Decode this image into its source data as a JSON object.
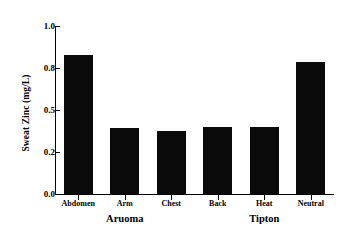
{
  "chart_data": {
    "type": "bar",
    "title": "",
    "xlabel": "",
    "ylabel": "Sweat Zinc (mg/L)",
    "categories": [
      "Abdomen",
      "Arm",
      "Chest",
      "Back",
      "Heat",
      "Neutral"
    ],
    "values": [
      0.86,
      0.37,
      0.35,
      0.38,
      0.38,
      0.83
    ],
    "ylim": [
      0.0,
      1.0
    ],
    "ytick_labels": [
      "1.0",
      "0.8",
      "0.5",
      "0.2",
      "0.0"
    ],
    "ytick_values": [
      1.0,
      0.8,
      0.5,
      0.2,
      0.0
    ],
    "grid": false,
    "legend": "none",
    "bar_color": "#0a0a0a",
    "groups": [
      {
        "label": "Aruoma",
        "categories": [
          "Abdomen",
          "Arm",
          "Chest"
        ]
      },
      {
        "label": "Tipton",
        "categories": [
          "Back",
          "Heat",
          "Neutral"
        ]
      }
    ]
  },
  "axes": {
    "y_label": "Sweat Zinc (mg/L)",
    "ticks": [
      {
        "label": "1.0"
      },
      {
        "label": "0.8"
      },
      {
        "label": "0.5"
      },
      {
        "label": "0.2"
      },
      {
        "label": "0.0"
      }
    ]
  },
  "bars": [
    {
      "label": "Abdomen",
      "value": 0.86
    },
    {
      "label": "Arm",
      "value": 0.37
    },
    {
      "label": "Chest",
      "value": 0.35
    },
    {
      "label": "Back",
      "value": 0.38
    },
    {
      "label": "Heat",
      "value": 0.38
    },
    {
      "label": "Neutral",
      "value": 0.83
    }
  ],
  "groups": [
    {
      "label": "Aruoma"
    },
    {
      "label": "Tipton"
    }
  ]
}
